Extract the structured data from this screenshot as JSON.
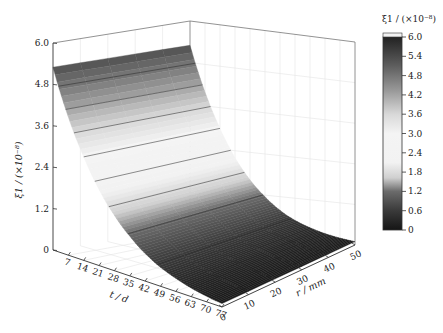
{
  "chart_data": {
    "type": "surface3d",
    "title": "",
    "x_axis": {
      "label": "t / d",
      "ticks": [
        "7",
        "14",
        "21",
        "28",
        "35",
        "42",
        "49",
        "56",
        "63",
        "70",
        "77"
      ],
      "range": [
        0,
        77
      ]
    },
    "y_axis": {
      "label": "r / mm",
      "ticks": [
        "0",
        "10",
        "20",
        "30",
        "40",
        "50"
      ],
      "range": [
        0,
        50
      ]
    },
    "z_axis": {
      "label": "ξ1 / (×10⁻⁸)",
      "ticks": [
        "0",
        "1.2",
        "2.4",
        "3.6",
        "4.8",
        "6.0"
      ],
      "range": [
        0,
        6.0
      ]
    },
    "colorbar": {
      "title": "ξ1 / (×10⁻⁸)",
      "ticks": [
        "6.0",
        "5.4",
        "4.8",
        "4.2",
        "3.6",
        "3.0",
        "2.4",
        "1.8",
        "1.2",
        "0.6",
        "0"
      ],
      "range": [
        0,
        6.0
      ],
      "stops": [
        [
          0,
          "#151515"
        ],
        [
          0.1,
          "#3a3a3a"
        ],
        [
          0.2,
          "#6b6b6b"
        ],
        [
          0.27,
          "#cfcfcf"
        ],
        [
          0.35,
          "#f2f2f2"
        ],
        [
          0.5,
          "#f4f4f4"
        ],
        [
          0.6,
          "#d8d8d8"
        ],
        [
          0.72,
          "#9a9a9a"
        ],
        [
          0.85,
          "#5e5e5e"
        ],
        [
          1.0,
          "#222222"
        ]
      ]
    },
    "series": [
      {
        "name": "ξ1(t, r)",
        "description": "exponential decay with t, approximately constant along r",
        "t": [
          0,
          7,
          14,
          21,
          28,
          35,
          42,
          49,
          56,
          63,
          70,
          77
        ],
        "values": [
          5.3,
          4.0,
          3.0,
          2.2,
          1.6,
          1.15,
          0.8,
          0.55,
          0.38,
          0.25,
          0.16,
          0.1
        ]
      }
    ],
    "contour_levels": [
      0.6,
      1.2,
      1.8,
      2.4,
      3.0,
      3.6,
      4.2,
      4.8
    ],
    "grid": true
  }
}
